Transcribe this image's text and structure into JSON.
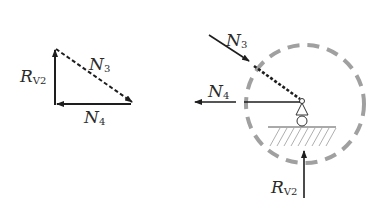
{
  "figure": {
    "left_polygon": {
      "labels": {
        "rv2": {
          "main": "R",
          "sub": "V2"
        },
        "n3": {
          "main": "N",
          "sub": "3"
        },
        "n4": {
          "main": "N",
          "sub": "4"
        }
      }
    },
    "right_fbd": {
      "labels": {
        "n3": {
          "main": "N",
          "sub": "3"
        },
        "n4": {
          "main": "N",
          "sub": "4"
        },
        "rv2": {
          "main": "R",
          "sub": "V2"
        }
      },
      "cut_circle_color": "#a0a0a0",
      "line_color": "#1e1e1e"
    }
  }
}
